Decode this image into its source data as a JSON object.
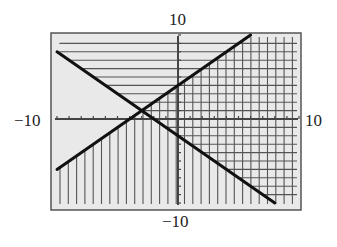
{
  "chart_data": {
    "type": "line",
    "title": "",
    "xlabel": "",
    "ylabel": "",
    "xlim": [
      -10,
      10
    ],
    "ylim": [
      -10,
      10
    ],
    "grid": false,
    "axis_labels": {
      "top": "10",
      "bottom": "−10",
      "left": "−10",
      "right": "10"
    },
    "series": [
      {
        "name": "boundary line 1",
        "equation": "y = -x - 2",
        "slope": -1,
        "intercept": -2,
        "x": [
          -10,
          8
        ],
        "y": [
          8,
          -10
        ]
      },
      {
        "name": "boundary line 2",
        "equation": "y = x + 4",
        "slope": 1,
        "intercept": 4,
        "x": [
          -10,
          6
        ],
        "y": [
          -6,
          10
        ]
      }
    ],
    "shaded_regions": [
      {
        "inequality": "y >= -x - 2",
        "pattern": "horizontal hatching"
      },
      {
        "inequality": "y <= x + 4",
        "pattern": "vertical hatching"
      }
    ],
    "intersection": {
      "x": -3,
      "y": 1
    },
    "tick_step": 1
  },
  "colors": {
    "background": "#e9e9e9",
    "frame": "#555555",
    "line": "#111111",
    "hatch": "#555555",
    "axis": "#444444"
  }
}
